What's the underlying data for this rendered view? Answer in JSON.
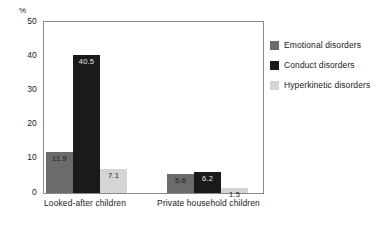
{
  "chart_data": {
    "type": "bar",
    "title": "",
    "xlabel": "",
    "ylabel": "%",
    "y_unit_label": "%",
    "ylim": [
      0,
      50
    ],
    "yticks": [
      50,
      40,
      30,
      20,
      10,
      0
    ],
    "ytick_labels": [
      "50",
      "40",
      "30",
      "20",
      "10",
      "0"
    ],
    "grid": false,
    "legend_position": "right",
    "categories": [
      "Looked-after children",
      "Private household children"
    ],
    "series": [
      {
        "name": "Emotional disorders",
        "color": "#6b6b6b",
        "values": [
          11.9,
          5.6
        ],
        "labels": [
          "11.9",
          "5.6"
        ]
      },
      {
        "name": "Conduct disorders",
        "color": "#1a1a1a",
        "values": [
          40.5,
          6.2
        ],
        "labels": [
          "40.5",
          "6.2"
        ]
      },
      {
        "name": "Hyperkinetic disorders",
        "color": "#d5d5d5",
        "values": [
          7.1,
          1.5
        ],
        "labels": [
          "7.1",
          "1.5"
        ]
      }
    ]
  },
  "legend": {
    "items": [
      {
        "label": "Emotional disorders",
        "color": "#6b6b6b"
      },
      {
        "label": "Conduct disorders",
        "color": "#1a1a1a"
      },
      {
        "label": "Hyperkinetic disorders",
        "color": "#d5d5d5"
      }
    ]
  },
  "colors": {
    "emotional": "#6b6b6b",
    "conduct": "#1a1a1a",
    "hyperkinetic": "#d5d5d5",
    "frame": "#8a8a8a",
    "background": "#ffffff",
    "text": "#1a1a1a"
  }
}
